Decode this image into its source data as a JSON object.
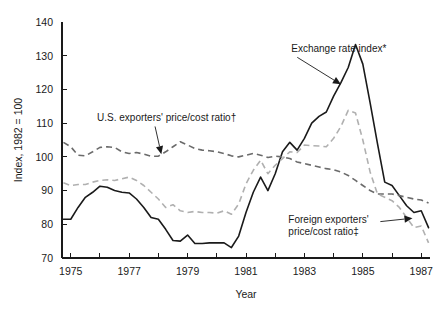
{
  "chart_data": {
    "type": "line",
    "title": "",
    "subtitle": "",
    "xlabel": "Year",
    "ylabel": "Index, 1982 = 100",
    "xlim": [
      1974.7,
      1987.3
    ],
    "ylim": [
      70,
      140
    ],
    "grid": false,
    "legend_position": "inline-annotations",
    "y_ticks": [
      70,
      80,
      90,
      100,
      110,
      120,
      130,
      140
    ],
    "y_tick_labels": [
      "70",
      "80",
      "90",
      "100",
      "110",
      "120",
      "130",
      "140"
    ],
    "x_ticks": [
      1975,
      1976,
      1977,
      1978,
      1979,
      1980,
      1981,
      1982,
      1983,
      1984,
      1985,
      1986,
      1987
    ],
    "x_tick_labels": [
      "1975",
      "",
      "1977",
      "",
      "1979",
      "",
      "1981",
      "",
      "1983",
      "",
      "1985",
      "",
      "1987"
    ],
    "x_labeled_ticks": [
      {
        "x": 1975,
        "label": "1975"
      },
      {
        "x": 1977,
        "label": "1977"
      },
      {
        "x": 1979,
        "label": "1979"
      },
      {
        "x": 1981,
        "label": "1981"
      },
      {
        "x": 1983,
        "label": "1983"
      },
      {
        "x": 1985,
        "label": "1985"
      },
      {
        "x": 1987,
        "label": "1987"
      }
    ],
    "x": [
      1974.75,
      1975.0,
      1975.25,
      1975.5,
      1975.75,
      1976.0,
      1976.25,
      1976.5,
      1976.75,
      1977.0,
      1977.25,
      1977.5,
      1977.75,
      1978.0,
      1978.25,
      1978.5,
      1978.75,
      1979.0,
      1979.25,
      1979.5,
      1979.75,
      1980.0,
      1980.25,
      1980.5,
      1980.75,
      1981.0,
      1981.25,
      1981.5,
      1981.75,
      1982.0,
      1982.25,
      1982.5,
      1982.75,
      1983.0,
      1983.25,
      1983.5,
      1983.75,
      1984.0,
      1984.25,
      1984.5,
      1984.75,
      1985.0,
      1985.25,
      1985.5,
      1985.75,
      1986.0,
      1986.25,
      1986.5,
      1986.75,
      1987.0,
      1987.25
    ],
    "series": [
      {
        "name": "Exchange rate index*",
        "style": "solid",
        "color": "#1a1a1a",
        "values": [
          81.5,
          81.5,
          85.0,
          88.0,
          89.5,
          91.3,
          91.0,
          90.0,
          89.5,
          89.3,
          87.5,
          85.0,
          82.0,
          81.5,
          78.5,
          75.2,
          75.0,
          76.8,
          74.3,
          74.3,
          74.5,
          74.5,
          74.5,
          73.1,
          76.5,
          83.5,
          89.5,
          94.0,
          90.0,
          95.0,
          101.5,
          104.3,
          102.0,
          105.5,
          110.0,
          112.0,
          113.3,
          118.0,
          122.0,
          126.5,
          133.3,
          127.5,
          116.0,
          104.0,
          92.5,
          91.5,
          88.5,
          85.5,
          83.5,
          84.0,
          79.0
        ]
      },
      {
        "name": "U.S. exporters' price/cost ratio†",
        "style": "dashed",
        "color": "#6b6b6b",
        "values": [
          104.3,
          103.0,
          100.5,
          100.3,
          101.5,
          102.8,
          103.0,
          102.8,
          101.5,
          101.0,
          101.3,
          100.8,
          100.2,
          100.2,
          101.5,
          103.0,
          104.5,
          103.5,
          102.5,
          102.0,
          101.8,
          101.5,
          101.0,
          100.3,
          100.0,
          100.5,
          101.0,
          100.5,
          99.8,
          100.2,
          100.0,
          99.5,
          98.5,
          98.0,
          97.5,
          97.0,
          96.5,
          96.2,
          95.5,
          94.5,
          93.0,
          91.5,
          90.0,
          89.0,
          89.0,
          89.0,
          88.5,
          88.0,
          87.5,
          87.2,
          86.3
        ]
      },
      {
        "name": "Foreign exporters' price/cost ratio‡",
        "style": "dashed",
        "color": "#b0b0b0",
        "values": [
          92.3,
          91.5,
          91.8,
          91.8,
          92.5,
          93.0,
          93.2,
          93.0,
          93.5,
          94.0,
          93.0,
          91.5,
          89.5,
          87.5,
          85.0,
          85.8,
          84.0,
          83.5,
          83.8,
          83.5,
          83.5,
          83.3,
          84.0,
          83.0,
          86.0,
          92.0,
          96.0,
          99.0,
          95.0,
          97.5,
          99.5,
          101.5,
          101.3,
          103.5,
          103.3,
          103.2,
          103.0,
          105.5,
          109.0,
          113.8,
          113.0,
          105.0,
          95.5,
          89.0,
          88.0,
          87.0,
          85.0,
          82.0,
          79.0,
          79.5,
          74.5
        ]
      }
    ],
    "annotations": [
      {
        "id": "exchange-rate-annotation",
        "text": "Exchange rate index*",
        "text_x": 1982.55,
        "text_y": 131.0,
        "target_x": 1984.25,
        "target_y": 121.5
      },
      {
        "id": "us-exporters-annotation",
        "text": "U.S. exporters' price/cost ratio†",
        "text_x": 1975.9,
        "text_y": 110.5,
        "target_x": 1978.1,
        "target_y": 100.8
      },
      {
        "id": "foreign-exporters-annotation",
        "line1": "Foreign exporters'",
        "line2": "price/cost ratio‡",
        "text_x": 1982.45,
        "text_y": 80.5,
        "target_x": 1986.7,
        "target_y": 81.8
      }
    ]
  },
  "axes": {
    "y_axis_title": "Index, 1982 = 100",
    "x_axis_title": "Year"
  }
}
